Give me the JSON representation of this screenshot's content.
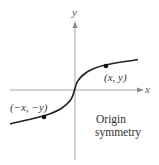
{
  "diagram": {
    "type": "function-graph",
    "axes": {
      "x_label": "x",
      "y_label": "y"
    },
    "points": [
      {
        "label": "(x, y)",
        "position": "first-quadrant"
      },
      {
        "label": "(−x, −y)",
        "position": "third-quadrant"
      }
    ],
    "caption": {
      "line1": "Origin",
      "line2": "symmetry"
    },
    "colors": {
      "axis": "#888888",
      "curve": "#222222",
      "point": "#111111",
      "text": "#333333"
    }
  }
}
